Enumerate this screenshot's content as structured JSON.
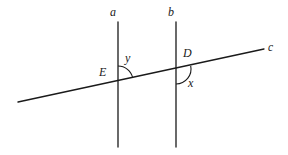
{
  "figure": {
    "background_color": "#ffffff",
    "stroke_color": "#1a1a1a",
    "label_color": "#1a1a1a",
    "width": 288,
    "height": 155,
    "labels": {
      "line_a": "a",
      "line_b": "b",
      "line_c": "c",
      "point_e": "E",
      "point_d": "D",
      "angle_y": "y",
      "angle_x": "x"
    },
    "geometry": {
      "line_a": {
        "x1": 118,
        "y1": 22,
        "x2": 118,
        "y2": 147
      },
      "line_b": {
        "x1": 176,
        "y1": 22,
        "x2": 176,
        "y2": 147
      },
      "line_c": {
        "x1": 18,
        "y1": 102,
        "x2": 264,
        "y2": 49
      },
      "intersection_e": {
        "x": 118,
        "y": 81
      },
      "intersection_d": {
        "x": 176,
        "y": 69
      },
      "arc_y": {
        "center_x": 118,
        "center_y": 81,
        "radius": 15
      },
      "arc_x": {
        "center_x": 176,
        "center_y": 69,
        "radius": 15
      }
    }
  }
}
